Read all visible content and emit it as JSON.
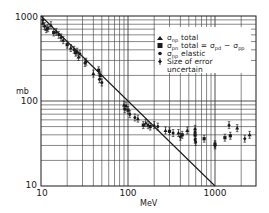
{
  "chart_data": {
    "type": "scatter",
    "title": "",
    "xlabel": "MeV",
    "ylabel": "mb",
    "xscale": "log",
    "yscale": "log",
    "xlim": [
      10,
      3000
    ],
    "ylim": [
      10,
      1000
    ],
    "grid": true,
    "x_tick_labels": [
      "10",
      "100",
      "1000"
    ],
    "y_tick_labels": [
      "10",
      "100",
      "1000"
    ],
    "legend_position": "upper right (inside)",
    "legend": [
      {
        "symbol": "triangle",
        "label": "σ_np total"
      },
      {
        "symbol": "square",
        "label": "σ_pn total = σ_pd − σ_pp"
      },
      {
        "symbol": "dot",
        "label": "σ_np elastic"
      },
      {
        "symbol": "diamond-errorbar",
        "label": "Size of error uncertain"
      }
    ],
    "reference_line": {
      "label": "σ ∝ 1/E",
      "points": [
        [
          10,
          1000
        ],
        [
          1000,
          10
        ]
      ]
    },
    "series": [
      {
        "name": "σ_np total",
        "marker": "triangle",
        "points": [
          [
            10.5,
            820
          ],
          [
            11.5,
            700
          ],
          [
            13,
            780
          ],
          [
            15,
            650
          ],
          [
            18,
            520
          ],
          [
            22,
            420
          ],
          [
            27,
            330
          ],
          [
            40,
            210
          ],
          [
            90,
            90
          ],
          [
            95,
            88
          ],
          [
            130,
            62
          ],
          [
            160,
            55
          ],
          [
            200,
            52
          ],
          [
            270,
            45
          ],
          [
            380,
            42
          ],
          [
            480,
            45
          ],
          [
            590,
            47
          ],
          [
            1800,
            48
          ],
          [
            2500,
            40
          ]
        ]
      },
      {
        "name": "σ_pn total = σ_pd − σ_pp",
        "marker": "square",
        "points": [
          [
            12,
            720
          ],
          [
            14,
            640
          ],
          [
            20,
            460
          ],
          [
            25,
            370
          ],
          [
            46,
            230
          ],
          [
            48,
            200
          ],
          [
            100,
            78
          ],
          [
            150,
            52
          ],
          [
            180,
            50
          ],
          [
            300,
            44
          ],
          [
            420,
            40
          ],
          [
            590,
            40
          ],
          [
            750,
            36
          ],
          [
            1000,
            31
          ],
          [
            1300,
            37
          ],
          [
            1500,
            39
          ]
        ]
      },
      {
        "name": "σ_np elastic",
        "marker": "dot",
        "points": [
          [
            11,
            760
          ],
          [
            16,
            600
          ],
          [
            24,
            400
          ],
          [
            26,
            380
          ],
          [
            28,
            360
          ],
          [
            32,
            280
          ],
          [
            47,
            180
          ],
          [
            50,
            165
          ],
          [
            92,
            80
          ],
          [
            120,
            64
          ],
          [
            220,
            50
          ],
          [
            330,
            42
          ],
          [
            400,
            38
          ],
          [
            590,
            35
          ],
          [
            600,
            33
          ],
          [
            1000,
            30
          ]
        ]
      },
      {
        "name": "Size of error uncertain",
        "marker": "diamond-errorbar",
        "points": [
          [
            10.5,
            900
          ],
          [
            17,
            560
          ],
          [
            33,
            290
          ],
          [
            105,
            70
          ],
          [
            170,
            52
          ],
          [
            590,
            43
          ],
          [
            1450,
            52
          ],
          [
            2200,
            36
          ]
        ]
      }
    ]
  },
  "labels": {
    "ylabel": "mb",
    "xlabel": "MeV",
    "y_ticks": [
      "1000",
      "100",
      "10"
    ],
    "x_ticks": [
      "10",
      "100",
      "1000"
    ],
    "legend": {
      "item1_sym": "σ",
      "item1_sub": "np",
      "item1_text": "total",
      "item2_sym": "σ",
      "item2_sub": "pn",
      "item2_text": "total =",
      "item2_rhs1": "σ",
      "item2_rhs1_sub": "pd",
      "item2_minus": "−",
      "item2_rhs2": "σ",
      "item2_rhs2_sub": "pp",
      "item3_sym": "σ",
      "item3_sub": "np",
      "item3_text": "elastic",
      "item4_text_line1": "Size of error",
      "item4_text_line2": "uncertain"
    }
  },
  "colors": {
    "ink": "#1a1a1a",
    "grid": "#3a3a3a",
    "background": "#ffffff"
  }
}
